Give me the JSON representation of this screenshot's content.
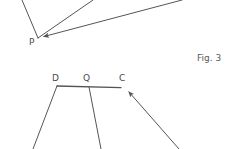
{
  "canvas": {
    "width": 237,
    "height": 149,
    "background": "#ffffff",
    "stroke_color": "#555555",
    "label_color": "#4a4a4a",
    "caption_color": "#5a5a5a"
  },
  "figure": {
    "caption": "Fig. 3",
    "upper": {
      "apex_label": "P",
      "apex": {
        "x": 38,
        "y": 38
      },
      "rays": [
        {
          "name": "ray-p-upper-left",
          "x1": 38,
          "y1": 38,
          "x2": 22,
          "y2": 0,
          "arrow": false
        },
        {
          "name": "ray-p-upper-right",
          "x1": 38,
          "y1": 38,
          "x2": 93,
          "y2": 0,
          "arrow": false
        },
        {
          "name": "ray-p-shallow-right",
          "x1": 182,
          "y1": 0,
          "x2": 40,
          "y2": 38,
          "arrow": true
        }
      ]
    },
    "lower": {
      "labels": [
        {
          "name": "point-d",
          "text": "D",
          "x": 52,
          "y": 74
        },
        {
          "name": "point-q",
          "text": "Q",
          "x": 83,
          "y": 74
        },
        {
          "name": "point-c",
          "text": "C",
          "x": 119,
          "y": 74
        }
      ],
      "baseline": {
        "name": "segment-dc",
        "x1": 57,
        "y1": 86,
        "x2": 125,
        "y2": 88
      },
      "legs": [
        {
          "name": "leg-d-down",
          "x1": 57,
          "y1": 86,
          "x2": 33,
          "y2": 149,
          "arrow": false
        },
        {
          "name": "leg-q-down",
          "x1": 89,
          "y1": 87,
          "x2": 101,
          "y2": 149,
          "arrow": false
        },
        {
          "name": "leg-c-incoming",
          "x1": 179,
          "y1": 149,
          "x2": 125,
          "y2": 88,
          "arrow": true
        }
      ]
    }
  }
}
